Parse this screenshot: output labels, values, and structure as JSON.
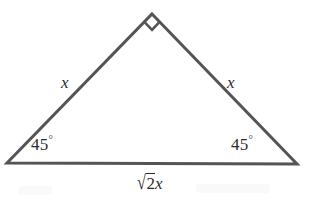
{
  "figure": {
    "type": "geometry-diagram",
    "shape": "right-isosceles-triangle",
    "background_color": "#ffffff",
    "stroke_color": "#555555",
    "text_color": "#2b2b2b",
    "stroke_width": 3,
    "vertices": {
      "apex": [
        152,
        14
      ],
      "bottom_left": [
        7,
        163
      ],
      "bottom_right": [
        297,
        164
      ]
    },
    "right_angle_marker": {
      "at_vertex": "apex",
      "style": "square",
      "size": 22
    }
  },
  "labels": {
    "left_leg": "x",
    "right_leg": "x",
    "left_angle_value": "45",
    "left_angle_unit": "°",
    "right_angle_value": "45",
    "right_angle_unit": "°",
    "hypotenuse_radical_sign": "√",
    "hypotenuse_radicand": "2",
    "hypotenuse_variable": "x",
    "hypotenuse_full": "√2x"
  }
}
